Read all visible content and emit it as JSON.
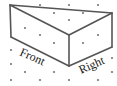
{
  "diagram": {
    "type": "isometric-dot-grid-solid",
    "colors": {
      "background": "#ffffff",
      "edge": "#555555",
      "dot": "#777777",
      "text": "#222222"
    },
    "labels": {
      "front": "Front",
      "right": "Right"
    },
    "vertices": {
      "top_left": [
        10,
        5
      ],
      "top_right": [
        112,
        13
      ],
      "front_top": [
        69,
        35
      ],
      "left_bottom": [
        11,
        37
      ],
      "front_bottom": [
        69,
        66
      ],
      "right_bottom": [
        112,
        47
      ]
    },
    "edges": [
      [
        "top_left",
        "top_right"
      ],
      [
        "top_left",
        "front_top"
      ],
      [
        "front_top",
        "top_right"
      ],
      [
        "top_left",
        "left_bottom"
      ],
      [
        "left_bottom",
        "front_bottom"
      ],
      [
        "front_top",
        "front_bottom"
      ],
      [
        "front_bottom",
        "right_bottom"
      ],
      [
        "top_right",
        "right_bottom"
      ]
    ],
    "dots": [
      [
        40,
        5
      ],
      [
        69,
        5
      ],
      [
        98,
        5
      ],
      [
        54,
        13
      ],
      [
        83,
        13
      ],
      [
        69,
        20
      ],
      [
        25,
        28
      ],
      [
        40,
        35
      ],
      [
        98,
        35
      ],
      [
        54,
        43
      ],
      [
        83,
        43
      ],
      [
        11,
        50
      ],
      [
        11,
        64
      ],
      [
        112,
        58
      ],
      [
        25,
        72
      ],
      [
        54,
        72
      ],
      [
        83,
        72
      ],
      [
        112,
        72
      ],
      [
        11,
        80
      ],
      [
        40,
        80
      ],
      [
        69,
        80
      ],
      [
        98,
        80
      ]
    ]
  }
}
